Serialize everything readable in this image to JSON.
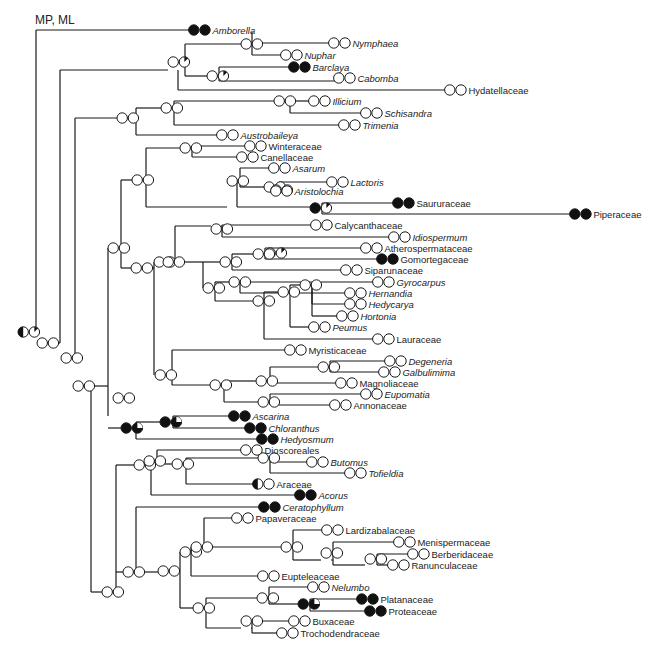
{
  "figure": {
    "method_label": "MP, ML",
    "legend": {
      "open_circle": "state 0 (absent)",
      "filled_circle": "state 1 (present)",
      "pie": "ambiguous / partial"
    }
  },
  "branches": [
    [
      36,
      30,
      36,
      332
    ],
    [
      36,
      30,
      193,
      30
    ],
    [
      36,
      332,
      45,
      332
    ],
    [
      60,
      70,
      60,
      340
    ],
    [
      60,
      70,
      66,
      70
    ],
    [
      66,
      70,
      66,
      43
    ],
    [
      66,
      70,
      178,
      70
    ],
    [
      178,
      70,
      178,
      55
    ],
    [
      178,
      55,
      205,
      55
    ],
    [
      205,
      55,
      205,
      43
    ],
    [
      205,
      43,
      343,
      43
    ],
    [
      205,
      55,
      205,
      55
    ],
    [
      178,
      70,
      178,
      76
    ],
    [
      178,
      76,
      186,
      76
    ],
    [
      186,
      70,
      186,
      88
    ],
    [
      205,
      55,
      205,
      55
    ],
    [
      185,
      55,
      185,
      88
    ],
    [
      185,
      88,
      210,
      88
    ],
    [
      210,
      88,
      210,
      94
    ],
    [
      210,
      94,
      296,
      94
    ],
    [
      210,
      94,
      210,
      100
    ],
    [
      210,
      100,
      336,
      100
    ],
    [
      185,
      70,
      200,
      70
    ],
    [
      187,
      55,
      196,
      55
    ],
    [
      196,
      55,
      196,
      43
    ],
    [
      252,
      43,
      343,
      43
    ],
    [
      252,
      43,
      252,
      55
    ],
    [
      252,
      55,
      290,
      55
    ],
    [
      120,
      70,
      120,
      118
    ],
    [
      120,
      118,
      450,
      118
    ],
    [
      75,
      82,
      75,
      365
    ],
    [
      75,
      82,
      75,
      82
    ],
    [
      80,
      118,
      80,
      118
    ],
    [
      120,
      100,
      120,
      126
    ],
    [
      135,
      118,
      135,
      118
    ],
    [
      171,
      108,
      171,
      126
    ],
    [
      171,
      108,
      313,
      108
    ],
    [
      171,
      118,
      171,
      118
    ],
    [
      135,
      118,
      135,
      135
    ],
    [
      135,
      135,
      227,
      135
    ],
    [
      171,
      118,
      182,
      118
    ],
    [
      182,
      118,
      182,
      108
    ],
    [
      182,
      118,
      182,
      125
    ],
    [
      182,
      125,
      344,
      125
    ],
    [
      120,
      118,
      135,
      118
    ],
    [
      60,
      340,
      70,
      340
    ],
    [
      75,
      365,
      85,
      365
    ],
    [
      100,
      385,
      100,
      592
    ],
    [
      100,
      385,
      107,
      385
    ],
    [
      115,
      365,
      115,
      385
    ],
    [
      121,
      292,
      121,
      425
    ],
    [
      106,
      425,
      121,
      425
    ],
    [
      150,
      180,
      150,
      292
    ],
    [
      150,
      180,
      162,
      180
    ],
    [
      162,
      180,
      182,
      180
    ],
    [
      182,
      150,
      182,
      197
    ],
    [
      182,
      150,
      247,
      150
    ],
    [
      182,
      158,
      182,
      158
    ],
    [
      182,
      158,
      236,
      158
    ],
    [
      182,
      197,
      204,
      197
    ],
    [
      204,
      180,
      204,
      210
    ],
    [
      204,
      180,
      229,
      180
    ],
    [
      229,
      170,
      229,
      190
    ],
    [
      229,
      170,
      295,
      170
    ],
    [
      229,
      180,
      229,
      180
    ],
    [
      229,
      190,
      259,
      190
    ],
    [
      259,
      180,
      259,
      190
    ],
    [
      259,
      180,
      334,
      180
    ],
    [
      259,
      190,
      264,
      190
    ],
    [
      264,
      190,
      264,
      190
    ],
    [
      264,
      190,
      345,
      190
    ],
    [
      204,
      210,
      320,
      210
    ],
    [
      320,
      205,
      320,
      215
    ],
    [
      320,
      205,
      403,
      205
    ],
    [
      320,
      215,
      581,
      215
    ],
    [
      128,
      292,
      152,
      292
    ],
    [
      152,
      262,
      152,
      385
    ],
    [
      152,
      262,
      162,
      262
    ],
    [
      162,
      232,
      162,
      262
    ],
    [
      162,
      232,
      221,
      232
    ],
    [
      221,
      228,
      221,
      232
    ],
    [
      221,
      228,
      237,
      228
    ],
    [
      226,
      232,
      226,
      237
    ],
    [
      226,
      237,
      355,
      237
    ],
    [
      152,
      385,
      172,
      385
    ],
    [
      172,
      352,
      172,
      385
    ],
    [
      172,
      352,
      301,
      352
    ],
    [
      172,
      385,
      189,
      385
    ],
    [
      189,
      365,
      189,
      390
    ],
    [
      189,
      365,
      230,
      365
    ],
    [
      230,
      360,
      230,
      370
    ],
    [
      230,
      360,
      371,
      360
    ],
    [
      230,
      370,
      355,
      370
    ],
    [
      189,
      390,
      222,
      390
    ],
    [
      222,
      385,
      222,
      392
    ],
    [
      222,
      385,
      363,
      385
    ],
    [
      222,
      400,
      222,
      400
    ],
    [
      172,
      395,
      172,
      395
    ],
    [
      97,
      268,
      97,
      318
    ],
    [
      97,
      268,
      103,
      268
    ],
    [
      103,
      268,
      103,
      268
    ],
    [
      104,
      268,
      115,
      268
    ],
    [
      115,
      268,
      115,
      290
    ],
    [
      121,
      268,
      127,
      268
    ],
    [
      127,
      268,
      127,
      292
    ],
    [
      135,
      292,
      150,
      292
    ],
    [
      107,
      340,
      107,
      340
    ],
    [
      115,
      292,
      115,
      292
    ]
  ],
  "tree": {
    "segments": [
      [
        36,
        30,
        36,
        332
      ],
      [
        36,
        30,
        193,
        30
      ],
      [
        49,
        343,
        60,
        343
      ],
      [
        60,
        343,
        60,
        70
      ],
      [
        60,
        70,
        165,
        70
      ],
      [
        165,
        57,
        165,
        70
      ],
      [
        175,
        57,
        175,
        70
      ],
      [
        165,
        57,
        165,
        57
      ],
      [
        179,
        57,
        179,
        44
      ],
      [
        179,
        44,
        252,
        44
      ],
      [
        252,
        44,
        252,
        20
      ],
      [
        252,
        20,
        336,
        20
      ],
      [
        262,
        44,
        262,
        30
      ],
      [
        262,
        30,
        340,
        30
      ],
      [
        179,
        57,
        179,
        62
      ],
      [
        174,
        62,
        174,
        75
      ],
      [
        174,
        75,
        210,
        75
      ],
      [
        212,
        75,
        212,
        66
      ],
      [
        212,
        66,
        296,
        66
      ],
      [
        212,
        75,
        212,
        84
      ],
      [
        212,
        84,
        336,
        84
      ],
      [
        180,
        57,
        180,
        94
      ],
      [
        180,
        94,
        450,
        94
      ],
      [
        67,
        350,
        75,
        350
      ],
      [
        75,
        350,
        75,
        118
      ],
      [
        75,
        118,
        123,
        118
      ],
      [
        123,
        118,
        123,
        100
      ],
      [
        123,
        100,
        170,
        100
      ],
      [
        174,
        92,
        174,
        108
      ],
      [
        174,
        92,
        313,
        92
      ],
      [
        178,
        108,
        178,
        108
      ],
      [
        178,
        108,
        344,
        108
      ],
      [
        174,
        100,
        174,
        100
      ],
      [
        127,
        118,
        127,
        135
      ],
      [
        127,
        135,
        220,
        135
      ],
      [
        75,
        350,
        75,
        350
      ],
      [
        100,
        362,
        100,
        292
      ],
      [
        100,
        292,
        115,
        292
      ],
      [
        120,
        292,
        120,
        268
      ],
      [
        120,
        268,
        125,
        268
      ],
      [
        130,
        268,
        130,
        180
      ],
      [
        130,
        180,
        145,
        180
      ],
      [
        150,
        180,
        150,
        152
      ],
      [
        150,
        152,
        180,
        152
      ],
      [
        185,
        152,
        185,
        146
      ],
      [
        185,
        146,
        250,
        146
      ],
      [
        185,
        152,
        185,
        158
      ],
      [
        185,
        158,
        245,
        158
      ],
      [
        150,
        180,
        150,
        207
      ],
      [
        150,
        207,
        196,
        207
      ],
      [
        205,
        207,
        205,
        183
      ],
      [
        205,
        183,
        228,
        183
      ],
      [
        235,
        183,
        235,
        170
      ],
      [
        235,
        170,
        290,
        170
      ],
      [
        235,
        183,
        235,
        190
      ],
      [
        235,
        190,
        262,
        190
      ],
      [
        272,
        190,
        272,
        184
      ],
      [
        272,
        184,
        326,
        184
      ],
      [
        276,
        190,
        276,
        196
      ],
      [
        276,
        196,
        337,
        196
      ],
      [
        205,
        207,
        205,
        210
      ],
      [
        205,
        210,
        317,
        210
      ],
      [
        322,
        205,
        322,
        203
      ],
      [
        322,
        203,
        396,
        203
      ],
      [
        322,
        210,
        322,
        215
      ],
      [
        322,
        215,
        578,
        215
      ],
      [
        130,
        268,
        130,
        268
      ],
      [
        125,
        268,
        130,
        268
      ],
      [
        130,
        268,
        130,
        296
      ]
    ]
  },
  "nodes": [
    {
      "x": 25,
      "y": 332,
      "a": "half",
      "b": "pie-open"
    },
    {
      "x": 49,
      "y": 343,
      "a": "open",
      "b": "open"
    },
    {
      "x": 66,
      "y": 358,
      "a": "open",
      "b": "open"
    },
    {
      "x": 78,
      "y": 386,
      "a": "open",
      "b": "open"
    },
    {
      "x": 114,
      "y": 82,
      "a": "open",
      "b": "open"
    },
    {
      "x": 114,
      "y": 118,
      "a": "open",
      "b": "open"
    },
    {
      "x": 125,
      "y": 108,
      "a": "open",
      "b": "open"
    },
    {
      "x": 164,
      "y": 62,
      "a": "open",
      "b": "pie-open"
    },
    {
      "x": 176,
      "y": 62,
      "a": "open",
      "b": "pie-open"
    }
  ],
  "taxa": [
    {
      "name": "Amborella",
      "italic": true,
      "y": 30,
      "x": 200,
      "a": "filled",
      "b": "filled"
    },
    {
      "name": "Nymphaea",
      "italic": true,
      "y": 43,
      "x": 340,
      "a": "open",
      "b": "open"
    },
    {
      "name": "Nuphar",
      "italic": true,
      "y": 55,
      "x": 292,
      "a": "open",
      "b": "open"
    },
    {
      "name": "Barclaya",
      "italic": true,
      "y": 67,
      "x": 300,
      "a": "filled",
      "b": "filled"
    },
    {
      "name": "Cabomba",
      "italic": true,
      "y": 78,
      "x": 345,
      "a": "open",
      "b": "open"
    },
    {
      "name": "Hydatellaceae",
      "italic": false,
      "y": 90,
      "x": 456,
      "a": "open",
      "b": "open"
    },
    {
      "name": "Illicium",
      "italic": true,
      "y": 101,
      "x": 320,
      "a": "open",
      "b": "open"
    },
    {
      "name": "Schisandra",
      "italic": true,
      "y": 113,
      "x": 372,
      "a": "open",
      "b": "open"
    },
    {
      "name": "Trimenia",
      "italic": true,
      "y": 125,
      "x": 350,
      "a": "open",
      "b": "open"
    },
    {
      "name": "Austrobaileya",
      "italic": true,
      "y": 135,
      "x": 228,
      "a": "open",
      "b": "open"
    },
    {
      "name": "Winteraceae",
      "italic": false,
      "y": 146,
      "x": 256,
      "a": "open",
      "b": "open"
    },
    {
      "name": "Canellaceae",
      "italic": false,
      "y": 157,
      "x": 248,
      "a": "open",
      "b": "open"
    },
    {
      "name": "Asarum",
      "italic": true,
      "y": 168,
      "x": 280,
      "a": "open",
      "b": "open"
    },
    {
      "name": "Lactoris",
      "italic": true,
      "y": 182,
      "x": 338,
      "a": "open",
      "b": "open"
    },
    {
      "name": "Aristolochia",
      "italic": true,
      "y": 191,
      "x": 282,
      "a": "open",
      "b": "open"
    },
    {
      "name": "Saururaceae",
      "italic": false,
      "y": 203,
      "x": 404,
      "a": "filled",
      "b": "filled"
    },
    {
      "name": "Piperaceae",
      "italic": false,
      "y": 214,
      "x": 581,
      "a": "filled",
      "b": "filled"
    },
    {
      "name": "Calycanthaceae",
      "italic": false,
      "y": 225,
      "x": 322,
      "a": "open",
      "b": "open"
    },
    {
      "name": "Idiospermum",
      "italic": true,
      "y": 237,
      "x": 400,
      "a": "open",
      "b": "open"
    },
    {
      "name": "Atherospermataceae",
      "italic": false,
      "y": 248,
      "x": 372,
      "a": "open",
      "b": "open"
    },
    {
      "name": "Gomortegaceae",
      "italic": false,
      "y": 259,
      "x": 388,
      "a": "filled",
      "b": "filled"
    },
    {
      "name": "Siparunaceae",
      "italic": false,
      "y": 270,
      "x": 352,
      "a": "open",
      "b": "open"
    },
    {
      "name": "Gyrocarpus",
      "italic": true,
      "y": 282,
      "x": 384,
      "a": "open",
      "b": "open"
    },
    {
      "name": "Hernandia",
      "italic": true,
      "y": 293,
      "x": 356,
      "a": "open",
      "b": "open"
    },
    {
      "name": "Hedycarya",
      "italic": true,
      "y": 304,
      "x": 356,
      "a": "open",
      "b": "open"
    },
    {
      "name": "Hortonia",
      "italic": true,
      "y": 316,
      "x": 348,
      "a": "open",
      "b": "open"
    },
    {
      "name": "Peumus",
      "italic": true,
      "y": 327,
      "x": 320,
      "a": "open",
      "b": "open"
    },
    {
      "name": "Lauraceae",
      "italic": false,
      "y": 339,
      "x": 384,
      "a": "open",
      "b": "open"
    },
    {
      "name": "Myristicaceae",
      "italic": false,
      "y": 350,
      "x": 296,
      "a": "open",
      "b": "open"
    },
    {
      "name": "Degeneria",
      "italic": true,
      "y": 361,
      "x": 396,
      "a": "open",
      "b": "open"
    },
    {
      "name": "Galbulimima",
      "italic": true,
      "y": 372,
      "x": 390,
      "a": "open",
      "b": "open"
    },
    {
      "name": "Magnoliaceae",
      "italic": false,
      "y": 383,
      "x": 347,
      "a": "open",
      "b": "open"
    },
    {
      "name": "Eupomatia",
      "italic": true,
      "y": 394,
      "x": 372,
      "a": "open",
      "b": "open"
    },
    {
      "name": "Annonaceae",
      "italic": false,
      "y": 405,
      "x": 341,
      "a": "open",
      "b": "open"
    },
    {
      "name": "Ascarina",
      "italic": true,
      "y": 416,
      "x": 240,
      "a": "filled",
      "b": "filled"
    },
    {
      "name": "Chloranthus",
      "italic": true,
      "y": 428,
      "x": 256,
      "a": "filled",
      "b": "filled"
    },
    {
      "name": "Hedyosmum",
      "italic": true,
      "y": 439,
      "x": 268,
      "a": "filled",
      "b": "filled"
    },
    {
      "name": "Dioscoreales",
      "italic": false,
      "y": 450,
      "x": 252,
      "a": "open",
      "b": "open"
    },
    {
      "name": "Butomus",
      "italic": true,
      "y": 462,
      "x": 318,
      "a": "open",
      "b": "open"
    },
    {
      "name": "Tofieldia",
      "italic": true,
      "y": 473,
      "x": 356,
      "a": "open",
      "b": "open"
    },
    {
      "name": "Araceae",
      "italic": false,
      "y": 484,
      "x": 264,
      "a": "half",
      "b": "open"
    },
    {
      "name": "Acorus",
      "italic": true,
      "y": 495,
      "x": 306,
      "a": "filled",
      "b": "filled"
    },
    {
      "name": "Ceratophyllum",
      "italic": true,
      "y": 507,
      "x": 270,
      "a": "filled",
      "b": "filled"
    },
    {
      "name": "Papaveraceae",
      "italic": false,
      "y": 518,
      "x": 243,
      "a": "open",
      "b": "open"
    },
    {
      "name": "Lardizabalaceae",
      "italic": false,
      "y": 530,
      "x": 333,
      "a": "open",
      "b": "open"
    },
    {
      "name": "Menispermaceae",
      "italic": false,
      "y": 542,
      "x": 405,
      "a": "open",
      "b": "open"
    },
    {
      "name": "Berberidaceae",
      "italic": false,
      "y": 554,
      "x": 419,
      "a": "open",
      "b": "open"
    },
    {
      "name": "Ranunculaceae",
      "italic": false,
      "y": 565,
      "x": 399,
      "a": "open",
      "b": "open"
    },
    {
      "name": "Eupteleaceae",
      "italic": false,
      "y": 576,
      "x": 269,
      "a": "open",
      "b": "open"
    },
    {
      "name": "Nelumbo",
      "italic": true,
      "y": 587,
      "x": 319,
      "a": "open",
      "b": "open"
    },
    {
      "name": "Platanaceae",
      "italic": false,
      "y": 599,
      "x": 368,
      "a": "filled",
      "b": "filled"
    },
    {
      "name": "Proteaceae",
      "italic": false,
      "y": 611,
      "x": 376,
      "a": "filled",
      "b": "filled"
    },
    {
      "name": "Buxaceae",
      "italic": false,
      "y": 621,
      "x": 300,
      "a": "open",
      "b": "open"
    },
    {
      "name": "Trochodendraceae",
      "italic": false,
      "y": 633,
      "x": 288,
      "a": "open",
      "b": "open"
    }
  ]
}
